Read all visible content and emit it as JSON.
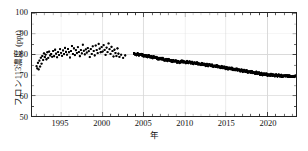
{
  "chart_data": {
    "type": "scatter",
    "title": "",
    "xlabel": "年",
    "ylabel": "フロン113濃度 (ppt)",
    "xlim": [
      1991.5,
      2023.5
    ],
    "ylim": [
      50,
      100
    ],
    "xticks": [
      1995,
      2000,
      2005,
      2010,
      2015,
      2020
    ],
    "yticks": [
      50,
      60,
      70,
      80,
      90,
      100
    ],
    "xtick_labels": [
      "1995",
      "2000",
      "2005",
      "2010",
      "2015",
      "2020"
    ],
    "ytick_labels": [
      "50",
      "60",
      "70",
      "80",
      "90",
      "100"
    ],
    "xminor_step": 1,
    "grid": true,
    "grid_color": "#d8d8d8",
    "legend": false,
    "marker_color": "#000000",
    "marker_size": 1.7,
    "series": [
      {
        "name": "CFC-113 concentration (sparse early observations)",
        "style": "scatter",
        "x": [
          1992.05,
          1992.14,
          1992.22,
          1992.31,
          1992.4,
          1992.48,
          1992.57,
          1992.66,
          1992.75,
          1992.85,
          1992.95,
          1993.05,
          1993.15,
          1993.25,
          1993.36,
          1993.47,
          1993.58,
          1993.7,
          1993.82,
          1993.94,
          1994.06,
          1994.18,
          1994.3,
          1994.42,
          1994.54,
          1994.66,
          1994.78,
          1994.9,
          1995.02,
          1995.14,
          1995.26,
          1995.38,
          1995.5,
          1995.62,
          1995.74,
          1995.86,
          1995.98,
          1996.1,
          1996.22,
          1996.34,
          1996.46,
          1996.58,
          1996.7,
          1996.82,
          1996.94,
          1997.06,
          1997.18,
          1997.3,
          1997.42,
          1997.54,
          1997.66,
          1997.78,
          1997.9,
          1998.02,
          1998.14,
          1998.26,
          1998.38,
          1998.5,
          1998.62,
          1998.74,
          1998.86,
          1998.98,
          1999.1,
          1999.22,
          1999.34,
          1999.46,
          1999.58,
          1999.7,
          1999.82,
          1999.94,
          2000.06,
          2000.18,
          2000.3,
          2000.42,
          2000.54,
          2000.66,
          2000.78,
          2000.9,
          2001.02,
          2001.14,
          2001.26,
          2001.38,
          2001.5,
          2001.62,
          2001.74,
          2001.86,
          2001.98,
          2002.1,
          2002.3,
          2002.55,
          2002.8
        ],
        "y": [
          74.2,
          73.1,
          75.8,
          72.6,
          76.9,
          74.0,
          78.3,
          75.4,
          79.1,
          77.2,
          80.4,
          78.6,
          79.8,
          77.5,
          80.9,
          78.2,
          81.3,
          79.4,
          80.1,
          78.8,
          81.6,
          79.0,
          82.2,
          80.3,
          78.5,
          81.0,
          79.6,
          82.4,
          80.7,
          79.2,
          81.8,
          80.0,
          83.1,
          81.2,
          79.8,
          82.6,
          80.9,
          78.4,
          81.5,
          84.0,
          80.2,
          82.8,
          79.5,
          81.9,
          80.6,
          83.4,
          81.1,
          79.0,
          82.0,
          80.4,
          84.6,
          81.7,
          79.9,
          82.3,
          80.8,
          83.0,
          81.4,
          78.6,
          82.5,
          80.1,
          83.8,
          81.6,
          79.4,
          84.2,
          82.0,
          80.5,
          85.0,
          82.7,
          80.9,
          83.5,
          81.3,
          84.4,
          82.1,
          79.7,
          83.2,
          81.0,
          85.2,
          82.4,
          80.2,
          83.6,
          81.5,
          78.9,
          82.2,
          80.6,
          79.1,
          82.8,
          80.3,
          78.7,
          79.8,
          78.2,
          79.4
        ]
      },
      {
        "name": "CFC-113 concentration (continuous record)",
        "style": "line-dense",
        "x": [
          2003.85,
          2004.0,
          2004.15,
          2004.3,
          2004.45,
          2004.6,
          2004.75,
          2004.9,
          2005.05,
          2005.2,
          2005.35,
          2005.5,
          2005.65,
          2005.8,
          2005.95,
          2006.1,
          2006.25,
          2006.4,
          2006.55,
          2006.7,
          2006.85,
          2007.0,
          2007.15,
          2007.3,
          2007.45,
          2007.6,
          2007.75,
          2007.9,
          2008.05,
          2008.2,
          2008.35,
          2008.5,
          2008.65,
          2008.8,
          2008.95,
          2009.1,
          2009.25,
          2009.4,
          2009.55,
          2009.7,
          2009.85,
          2010.0,
          2010.15,
          2010.3,
          2010.45,
          2010.6,
          2010.75,
          2010.9,
          2011.05,
          2011.2,
          2011.35,
          2011.5,
          2011.65,
          2011.8,
          2011.95,
          2012.1,
          2012.25,
          2012.4,
          2012.55,
          2012.7,
          2012.85,
          2013.0,
          2013.15,
          2013.3,
          2013.45,
          2013.6,
          2013.75,
          2013.9,
          2014.05,
          2014.2,
          2014.35,
          2014.5,
          2014.65,
          2014.8,
          2014.95,
          2015.1,
          2015.25,
          2015.4,
          2015.55,
          2015.7,
          2015.85,
          2016.0,
          2016.15,
          2016.3,
          2016.45,
          2016.6,
          2016.75,
          2016.9,
          2017.05,
          2017.2,
          2017.35,
          2017.5,
          2017.65,
          2017.8,
          2017.95,
          2018.1,
          2018.25,
          2018.4,
          2018.55,
          2018.7,
          2018.85,
          2019.0,
          2019.15,
          2019.3,
          2019.45,
          2019.6,
          2019.75,
          2019.9,
          2020.05,
          2020.2,
          2020.35,
          2020.5,
          2020.65,
          2020.8,
          2020.95,
          2021.1,
          2021.25,
          2021.4,
          2021.55,
          2021.7,
          2021.85,
          2022.0,
          2022.2,
          2022.45,
          2022.7,
          2022.95,
          2023.2,
          2023.45
        ],
        "y": [
          80.1,
          80.0,
          79.9,
          80.2,
          79.8,
          79.6,
          79.9,
          79.5,
          79.2,
          79.6,
          79.0,
          78.8,
          79.1,
          78.6,
          78.9,
          78.4,
          78.7,
          78.2,
          78.5,
          78.0,
          77.8,
          78.1,
          77.6,
          77.9,
          77.4,
          77.1,
          77.5,
          77.0,
          77.3,
          76.8,
          77.0,
          76.6,
          76.9,
          76.4,
          76.7,
          76.2,
          76.5,
          76.0,
          76.3,
          76.6,
          76.1,
          76.4,
          76.0,
          76.3,
          75.9,
          76.2,
          75.8,
          76.0,
          75.6,
          75.9,
          75.4,
          75.7,
          75.2,
          75.5,
          75.0,
          75.3,
          74.9,
          75.2,
          74.7,
          75.0,
          74.6,
          74.9,
          74.4,
          74.7,
          74.2,
          74.5,
          74.0,
          74.3,
          73.8,
          74.1,
          73.6,
          73.9,
          73.4,
          73.7,
          73.2,
          73.5,
          73.0,
          73.3,
          72.8,
          73.1,
          72.6,
          72.9,
          72.4,
          72.7,
          72.2,
          72.5,
          72.0,
          72.3,
          71.8,
          72.1,
          71.6,
          71.9,
          71.4,
          71.7,
          71.2,
          71.5,
          71.0,
          71.3,
          70.8,
          71.1,
          70.6,
          70.9,
          70.4,
          70.7,
          70.2,
          70.5,
          70.0,
          70.3,
          69.9,
          70.2,
          69.8,
          70.1,
          69.7,
          70.0,
          69.6,
          69.9,
          69.5,
          69.8,
          69.4,
          69.7,
          69.3,
          69.5,
          69.4,
          69.4,
          69.3,
          69.3,
          69.2,
          69.2
        ]
      }
    ]
  }
}
